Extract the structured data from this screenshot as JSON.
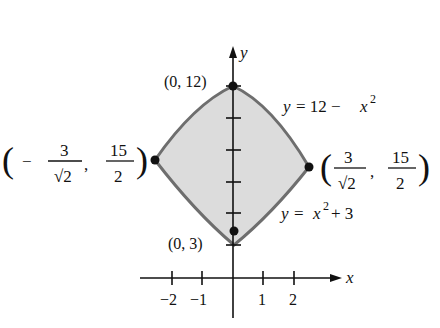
{
  "figure": {
    "kind": "region between two parabolas",
    "colors": {
      "fill": "#dcdcdc",
      "boundary": "#6e6e6e",
      "axes": "#111111",
      "points": "#111111",
      "background": "#ffffff"
    },
    "axes": {
      "x_label": "x",
      "y_label": "y",
      "x_ticks": [
        {
          "value": -2,
          "label": "−2"
        },
        {
          "value": -1,
          "label": "−1"
        },
        {
          "value": 1,
          "label": "1"
        },
        {
          "value": 2,
          "label": "2"
        }
      ],
      "y_tick_count_visible": 6
    },
    "curves": [
      {
        "id": "upper",
        "equation": "y = 12 − x²",
        "label_main": "y = 12 − x",
        "label_sup": "2"
      },
      {
        "id": "lower",
        "equation": "y = x² + 3",
        "label_main": "y = x",
        "label_sup": "2",
        "label_tail": " + 3"
      }
    ],
    "points": [
      {
        "id": "top",
        "label": "(0, 12)"
      },
      {
        "id": "bottom",
        "label": "(0, 3)"
      },
      {
        "id": "left",
        "label_sign": "−",
        "label_num_x": "3",
        "label_den_x": "√2",
        "label_num_y": "15",
        "label_den_y": "2"
      },
      {
        "id": "right",
        "label_sign": "",
        "label_num_x": "3",
        "label_den_x": "√2",
        "label_num_y": "15",
        "label_den_y": "2"
      }
    ]
  }
}
